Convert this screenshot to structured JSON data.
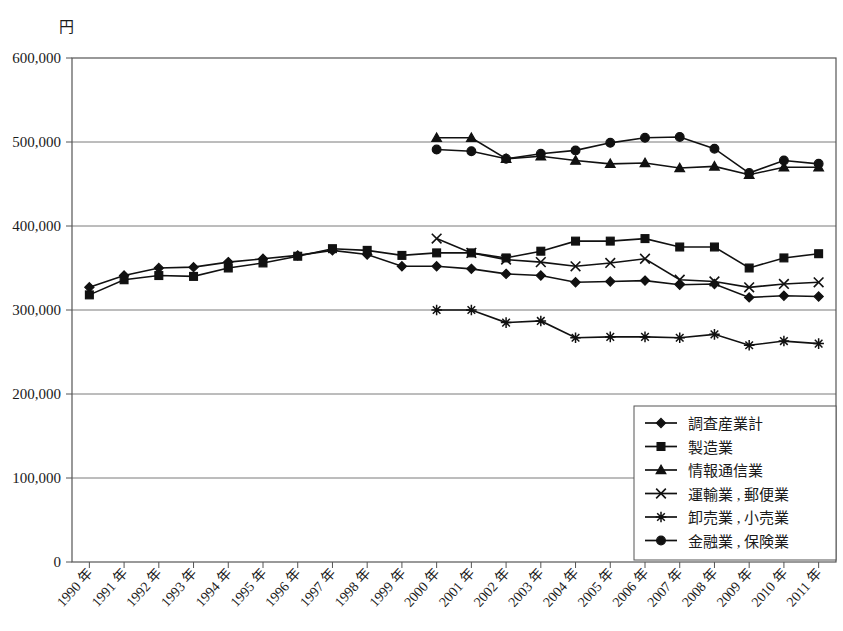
{
  "chart_data": {
    "type": "line",
    "title": "",
    "unit_label": "円",
    "xlabel": "",
    "ylabel": "",
    "ylim": [
      0,
      600000
    ],
    "ytick_labels": [
      "0",
      "100,000",
      "200,000",
      "300,000",
      "400,000",
      "500,000",
      "600,000"
    ],
    "ytick_values": [
      0,
      100000,
      200000,
      300000,
      400000,
      500000,
      600000
    ],
    "grid": true,
    "legend_position": "bottom-right",
    "categories": [
      "1990 年",
      "1991 年",
      "1992 年",
      "1993 年",
      "1994 年",
      "1995 年",
      "1996 年",
      "1997 年",
      "1998 年",
      "1999 年",
      "2000 年",
      "2001 年",
      "2002 年",
      "2003 年",
      "2004 年",
      "2005 年",
      "2006 年",
      "2007 年",
      "2008 年",
      "2009 年",
      "2010 年",
      "2011 年"
    ],
    "series": [
      {
        "name": "調査産業計",
        "marker": "diamond",
        "values": [
          327000,
          341000,
          350000,
          351000,
          357000,
          361000,
          365000,
          371000,
          366000,
          352000,
          352000,
          349000,
          343000,
          341000,
          333000,
          334000,
          335000,
          330000,
          331000,
          315000,
          317000,
          316000
        ]
      },
      {
        "name": "製造業",
        "marker": "square",
        "values": [
          318000,
          336000,
          341000,
          340000,
          350000,
          356000,
          364000,
          373000,
          371000,
          365000,
          368000,
          368000,
          362000,
          370000,
          382000,
          382000,
          385000,
          375000,
          375000,
          350000,
          362000,
          367000
        ]
      },
      {
        "name": "情報通信業",
        "marker": "triangle",
        "values": [
          null,
          null,
          null,
          null,
          null,
          null,
          null,
          null,
          null,
          null,
          505000,
          505000,
          480000,
          483000,
          478000,
          474000,
          475000,
          469000,
          471000,
          461000,
          470000,
          470000
        ]
      },
      {
        "name": "運輸業 , 郵便業",
        "marker": "x",
        "values": [
          null,
          null,
          null,
          null,
          null,
          null,
          null,
          null,
          null,
          null,
          385000,
          368000,
          360000,
          357000,
          352000,
          356000,
          361000,
          336000,
          334000,
          327000,
          331000,
          333000
        ]
      },
      {
        "name": "卸売業 , 小売業",
        "marker": "asterisk",
        "values": [
          null,
          null,
          null,
          null,
          null,
          null,
          null,
          null,
          null,
          null,
          300000,
          300000,
          285000,
          287000,
          267000,
          268000,
          268000,
          267000,
          271000,
          258000,
          263000,
          260000
        ]
      },
      {
        "name": "金融業 , 保険業",
        "marker": "circle",
        "values": [
          null,
          null,
          null,
          null,
          null,
          null,
          null,
          null,
          null,
          null,
          491000,
          489000,
          480000,
          486000,
          490000,
          499000,
          505000,
          506000,
          492000,
          463000,
          478000,
          474000
        ]
      }
    ]
  }
}
